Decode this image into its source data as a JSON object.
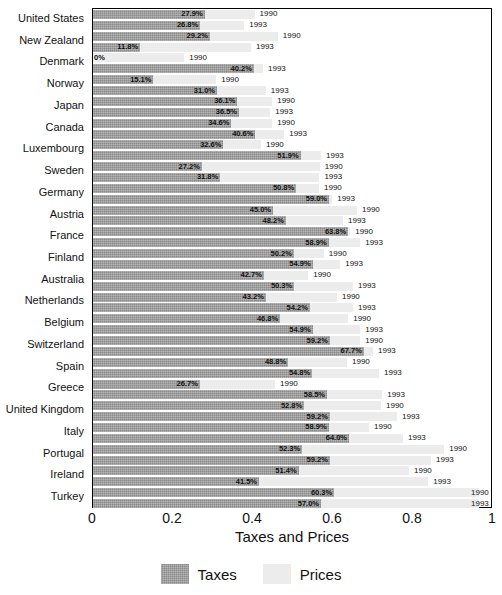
{
  "chart_data": {
    "type": "bar",
    "orientation": "horizontal",
    "stacked": true,
    "title": "",
    "xlabel": "Taxes and Prices",
    "ylabel": "",
    "xlim": [
      0,
      1
    ],
    "xticks": [
      "0",
      "0.2",
      "0.4",
      "0.6",
      "0.8",
      "1"
    ],
    "xtick_values": [
      0,
      0.2,
      0.4,
      0.6,
      0.8,
      1
    ],
    "grid": false,
    "legend_position": "bottom",
    "series": [
      {
        "name": "Taxes",
        "color": "#8a8a8a"
      },
      {
        "name": "Prices",
        "color": "#ececec"
      }
    ],
    "group_labels": [
      "1990",
      "1993"
    ],
    "categories": [
      "United States",
      "New Zealand",
      "Denmark",
      "Norway",
      "Japan",
      "Canada",
      "Luxembourg",
      "Sweden",
      "Germany",
      "Austria",
      "France",
      "Finland",
      "Australia",
      "Netherlands",
      "Belgium",
      "Switzerland",
      "Spain",
      "Greece",
      "United Kingdom",
      "Italy",
      "Portugal",
      "Ireland",
      "Turkey"
    ],
    "rows": [
      {
        "category": "United States",
        "year": "1990",
        "tax": 0.279,
        "tax_label": "27.9%",
        "total": 0.404
      },
      {
        "category": "United States",
        "year": "1993",
        "tax": 0.268,
        "tax_label": "26.8%",
        "total": 0.378
      },
      {
        "category": "New Zealand",
        "year": "1990",
        "tax": 0.292,
        "tax_label": "29.2%",
        "total": 0.462
      },
      {
        "category": "New Zealand",
        "year": "1993",
        "tax": 0.118,
        "tax_label": "11.8%",
        "total": 0.395
      },
      {
        "category": "Denmark",
        "year": "1990",
        "tax": 0.0,
        "tax_label": "0%",
        "total": 0.228
      },
      {
        "category": "Denmark",
        "year": "1993",
        "tax": 0.402,
        "tax_label": "40.2%",
        "total": 0.425
      },
      {
        "category": "Norway",
        "year": "1990",
        "tax": 0.151,
        "tax_label": "15.1%",
        "total": 0.308
      },
      {
        "category": "Norway",
        "year": "1993",
        "tax": 0.31,
        "tax_label": "31.0%",
        "total": 0.432
      },
      {
        "category": "Japan",
        "year": "1990",
        "tax": 0.361,
        "tax_label": "36.1%",
        "total": 0.448
      },
      {
        "category": "Japan",
        "year": "1993",
        "tax": 0.365,
        "tax_label": "36.5%",
        "total": 0.443
      },
      {
        "category": "Canada",
        "year": "1990",
        "tax": 0.346,
        "tax_label": "34.6%",
        "total": 0.448
      },
      {
        "category": "Canada",
        "year": "1993",
        "tax": 0.406,
        "tax_label": "40.6%",
        "total": 0.478
      },
      {
        "category": "Luxembourg",
        "year": "1990",
        "tax": 0.326,
        "tax_label": "32.6%",
        "total": 0.42
      },
      {
        "category": "Luxembourg",
        "year": "1993",
        "tax": 0.519,
        "tax_label": "51.9%",
        "total": 0.57
      },
      {
        "category": "Sweden",
        "year": "1990",
        "tax": 0.272,
        "tax_label": "27.2%",
        "total": 0.567
      },
      {
        "category": "Sweden",
        "year": "1993",
        "tax": 0.318,
        "tax_label": "31.8%",
        "total": 0.566
      },
      {
        "category": "Germany",
        "year": "1990",
        "tax": 0.508,
        "tax_label": "50.8%",
        "total": 0.565
      },
      {
        "category": "Germany",
        "year": "1993",
        "tax": 0.59,
        "tax_label": "59.0%",
        "total": 0.598
      },
      {
        "category": "Austria",
        "year": "1990",
        "tax": 0.45,
        "tax_label": "45.0%",
        "total": 0.66
      },
      {
        "category": "Austria",
        "year": "1993",
        "tax": 0.482,
        "tax_label": "48.2%",
        "total": 0.625
      },
      {
        "category": "France",
        "year": "1990",
        "tax": 0.638,
        "tax_label": "63.8%",
        "total": 0.643
      },
      {
        "category": "France",
        "year": "1993",
        "tax": 0.589,
        "tax_label": "58.9%",
        "total": 0.668
      },
      {
        "category": "Finland",
        "year": "1990",
        "tax": 0.502,
        "tax_label": "50.2%",
        "total": 0.577
      },
      {
        "category": "Finland",
        "year": "1993",
        "tax": 0.549,
        "tax_label": "54.9%",
        "total": 0.618
      },
      {
        "category": "Australia",
        "year": "1990",
        "tax": 0.427,
        "tax_label": "42.7%",
        "total": 0.538
      },
      {
        "category": "Australia",
        "year": "1993",
        "tax": 0.503,
        "tax_label": "50.3%",
        "total": 0.65
      },
      {
        "category": "Netherlands",
        "year": "1990",
        "tax": 0.432,
        "tax_label": "43.2%",
        "total": 0.61
      },
      {
        "category": "Netherlands",
        "year": "1993",
        "tax": 0.542,
        "tax_label": "54.2%",
        "total": 0.65
      },
      {
        "category": "Belgium",
        "year": "1990",
        "tax": 0.468,
        "tax_label": "46.8%",
        "total": 0.638
      },
      {
        "category": "Belgium",
        "year": "1993",
        "tax": 0.549,
        "tax_label": "54.9%",
        "total": 0.668
      },
      {
        "category": "Switzerland",
        "year": "1990",
        "tax": 0.592,
        "tax_label": "59.2%",
        "total": 0.668
      },
      {
        "category": "Switzerland",
        "year": "1993",
        "tax": 0.677,
        "tax_label": "67.7%",
        "total": 0.7
      },
      {
        "category": "Spain",
        "year": "1990",
        "tax": 0.488,
        "tax_label": "48.8%",
        "total": 0.635
      },
      {
        "category": "Spain",
        "year": "1993",
        "tax": 0.548,
        "tax_label": "54.8%",
        "total": 0.715
      },
      {
        "category": "Greece",
        "year": "1990",
        "tax": 0.267,
        "tax_label": "26.7%",
        "total": 0.455
      },
      {
        "category": "Greece",
        "year": "1993",
        "tax": 0.585,
        "tax_label": "58.5%",
        "total": 0.723
      },
      {
        "category": "United Kingdom",
        "year": "1990",
        "tax": 0.528,
        "tax_label": "52.8%",
        "total": 0.72
      },
      {
        "category": "United Kingdom",
        "year": "1993",
        "tax": 0.592,
        "tax_label": "59.2%",
        "total": 0.76
      },
      {
        "category": "Italy",
        "year": "1990",
        "tax": 0.589,
        "tax_label": "58.9%",
        "total": 0.69
      },
      {
        "category": "Italy",
        "year": "1993",
        "tax": 0.64,
        "tax_label": "64.0%",
        "total": 0.775
      },
      {
        "category": "Portugal",
        "year": "1990",
        "tax": 0.523,
        "tax_label": "52.3%",
        "total": 0.878
      },
      {
        "category": "Portugal",
        "year": "1993",
        "tax": 0.592,
        "tax_label": "59.2%",
        "total": 0.845
      },
      {
        "category": "Ireland",
        "year": "1990",
        "tax": 0.514,
        "tax_label": "51.4%",
        "total": 0.79
      },
      {
        "category": "Ireland",
        "year": "1993",
        "tax": 0.415,
        "tax_label": "41.5%",
        "total": 0.838
      },
      {
        "category": "Turkey",
        "year": "1990",
        "tax": 0.603,
        "tax_label": "60.3%",
        "total": 0.965
      },
      {
        "category": "Turkey",
        "year": "1993",
        "tax": 0.57,
        "tax_label": "57.0%",
        "total": 0.965
      }
    ]
  },
  "legend": {
    "items": [
      {
        "label": "Taxes",
        "swatch": "tax"
      },
      {
        "label": "Prices",
        "swatch": "price"
      }
    ]
  },
  "axis": {
    "x_title": "Taxes and Prices"
  }
}
